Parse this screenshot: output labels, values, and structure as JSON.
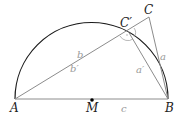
{
  "diagram": {
    "type": "geometry",
    "colors": {
      "arc": "#1a1a1a",
      "lines": "#8c8c8c",
      "point": "#000000",
      "point_labels": "#222222",
      "side_labels": "#9a9a9a"
    },
    "points": {
      "A": {
        "label": "A",
        "x": 15,
        "y": 99
      },
      "B": {
        "label": "B",
        "x": 168,
        "y": 99
      },
      "M": {
        "label": "M",
        "x": 92,
        "y": 99
      },
      "C": {
        "label": "C",
        "x": 149,
        "y": 17
      },
      "Cp": {
        "label": "C′",
        "x": 128,
        "y": 31
      }
    },
    "side_labels": {
      "c": "c",
      "b": "b",
      "b_prime": "b′",
      "a": "a",
      "a_prime": "a′"
    }
  }
}
